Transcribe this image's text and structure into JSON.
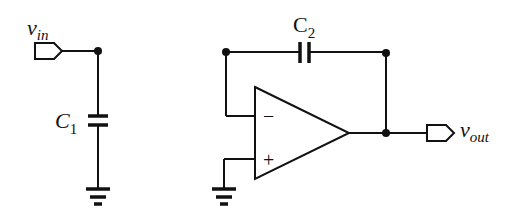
{
  "diagram": {
    "type": "circuit-schematic",
    "labels": {
      "vin_main": "v",
      "vin_sub": "in",
      "vout_main": "v",
      "vout_sub": "out",
      "c1_main": "C",
      "c1_sub": "1",
      "c2_main": "C",
      "c2_sub": "2",
      "opamp_minus": "−",
      "opamp_plus": "+"
    },
    "components": [
      {
        "id": "vin-port",
        "kind": "input-port"
      },
      {
        "id": "C1",
        "kind": "capacitor",
        "connects": [
          "vin node",
          "ground"
        ]
      },
      {
        "id": "opamp",
        "kind": "op-amp",
        "inputs": [
          "inverting",
          "non-inverting (ground)"
        ]
      },
      {
        "id": "C2",
        "kind": "capacitor",
        "connects": [
          "inverting input",
          "output"
        ]
      },
      {
        "id": "vout-port",
        "kind": "output-port"
      }
    ],
    "colors": {
      "ink": "#111111",
      "background": "#ffffff"
    }
  }
}
